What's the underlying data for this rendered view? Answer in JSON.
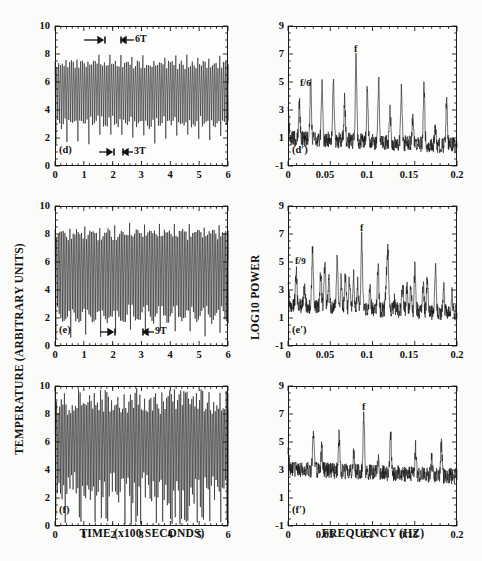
{
  "figure": {
    "caption_absent": true,
    "axis_titles": {
      "left_y": "TEMPERATURE (ARBITRARY UNITS)",
      "left_x": "TIME (x100 SECONDS)",
      "right_y": "LOG10 POWER",
      "right_x": "FREQUENCY (HZ)"
    },
    "ink_color": "#111111",
    "paper_color": "#fbfbf9"
  },
  "chart_data": [
    {
      "id": "d",
      "type": "line",
      "panel_label": "(d)",
      "title": "",
      "xlabel": "TIME (x100 SECONDS)",
      "ylabel": "TEMPERATURE (ARBITRARY UNITS)",
      "xlim": [
        0,
        6
      ],
      "ylim": [
        0,
        10
      ],
      "xticks": [
        0,
        1,
        2,
        3,
        4,
        5,
        6
      ],
      "xticklabels": [
        "0",
        "1",
        "2",
        "3",
        "4",
        "5",
        "6"
      ],
      "yticks": [
        0,
        2,
        4,
        6,
        8,
        10
      ],
      "yticklabels": [
        "0",
        "2",
        "4",
        "6",
        "8",
        "10"
      ],
      "grid": false,
      "series_description": "period-6 relaxation oscillation, temperature vs time",
      "waveform": {
        "base_period": 0.0635,
        "mean": 5.6,
        "fast_amplitude": 1.05,
        "pattern_period_multiple": 6,
        "large_spike_low": 1.9,
        "large_spike_high": 7.7,
        "seed": 41
      },
      "annotations": [
        {
          "label": "6T",
          "type": "interval-bar",
          "x_start": 1.0,
          "x_end": 1.72,
          "y": 9.0,
          "second_bar": {
            "x_start": 2.4,
            "x_end": 2.95
          }
        },
        {
          "label": "3T",
          "type": "interval-bar",
          "x_start": 1.55,
          "x_end": 2.0,
          "y": 0.75,
          "second_bar": {
            "x_start": 2.35,
            "x_end": 2.7
          }
        }
      ]
    },
    {
      "id": "d-prime",
      "type": "line",
      "panel_label": "(d′)",
      "title": "",
      "xlabel": "FREQUENCY (HZ)",
      "ylabel": "LOG10 POWER",
      "xlim": [
        0,
        0.2
      ],
      "ylim": [
        -1,
        9
      ],
      "xticks": [
        0,
        0.05,
        0.1,
        0.15,
        0.2
      ],
      "xticklabels": [
        "0",
        "0.05",
        "0.1",
        "0.15",
        "0.2"
      ],
      "yticks": [
        -1,
        1,
        3,
        5,
        7,
        9
      ],
      "yticklabels": [
        "-1",
        "1",
        "3",
        "5",
        "7",
        "9"
      ],
      "grid": false,
      "series_description": "power spectrum with fundamental f and subharmonic f/6",
      "fundamental_hz": 0.0805,
      "subharmonic_label": "f/6",
      "subharmonic_hz": 0.0134,
      "baseline": 1.0,
      "peaks": [
        {
          "hz": 0.0,
          "power": 3.7
        },
        {
          "hz": 0.0134,
          "power": 3.6
        },
        {
          "hz": 0.0268,
          "power": 5.1
        },
        {
          "hz": 0.0402,
          "power": 5.0
        },
        {
          "hz": 0.0537,
          "power": 5.4
        },
        {
          "hz": 0.0671,
          "power": 3.9
        },
        {
          "hz": 0.0805,
          "power": 7.3
        },
        {
          "hz": 0.0939,
          "power": 4.7
        },
        {
          "hz": 0.1073,
          "power": 5.3
        },
        {
          "hz": 0.1208,
          "power": 3.3
        },
        {
          "hz": 0.1342,
          "power": 4.9
        },
        {
          "hz": 0.1476,
          "power": 2.6
        },
        {
          "hz": 0.161,
          "power": 5.1
        },
        {
          "hz": 0.1744,
          "power": 2.2
        },
        {
          "hz": 0.1878,
          "power": 4.4
        }
      ]
    },
    {
      "id": "e",
      "type": "line",
      "panel_label": "(e)",
      "title": "",
      "xlabel": "TIME (x100 SECONDS)",
      "ylabel": "TEMPERATURE (ARBITRARY UNITS)",
      "xlim": [
        0,
        6
      ],
      "ylim": [
        0,
        10
      ],
      "xticks": [
        0,
        1,
        2,
        3,
        4,
        5,
        6
      ],
      "xticklabels": [
        "0",
        "1",
        "2",
        "3",
        "4",
        "5",
        "6"
      ],
      "yticks": [
        0,
        2,
        4,
        6,
        8,
        10
      ],
      "yticklabels": [
        "0",
        "2",
        "4",
        "6",
        "8",
        "10"
      ],
      "grid": false,
      "series_description": "period-9 relaxation oscillation, temperature vs time",
      "waveform": {
        "base_period": 0.0575,
        "mean": 5.7,
        "fast_amplitude": 1.5,
        "pattern_period_multiple": 9,
        "large_spike_low": 0.9,
        "large_spike_high": 8.6,
        "seed": 77
      },
      "annotations": [
        {
          "label": "9T",
          "type": "interval-bar",
          "x_start": 1.6,
          "x_end": 2.05,
          "y": 0.75,
          "second_bar": {
            "x_start": 3.1,
            "x_end": 3.45
          }
        }
      ]
    },
    {
      "id": "e-prime",
      "type": "line",
      "panel_label": "(e′)",
      "title": "",
      "xlabel": "FREQUENCY (HZ)",
      "ylabel": "LOG10 POWER",
      "xlim": [
        0,
        0.2
      ],
      "ylim": [
        -1,
        9
      ],
      "xticks": [
        0,
        0.05,
        0.1,
        0.15,
        0.2
      ],
      "xticklabels": [
        "0",
        "0.05",
        "0.1",
        "0.15",
        "0.2"
      ],
      "yticks": [
        -1,
        1,
        3,
        5,
        7,
        9
      ],
      "yticklabels": [
        "-1",
        "1",
        "3",
        "5",
        "7",
        "9"
      ],
      "grid": false,
      "series_description": "power spectrum with fundamental f and subharmonic f/9",
      "fundamental_hz": 0.0872,
      "subharmonic_label": "f/9",
      "subharmonic_hz": 0.0097,
      "baseline": 1.9,
      "peaks": [
        {
          "hz": 0.0,
          "power": 4.0
        },
        {
          "hz": 0.0097,
          "power": 4.3
        },
        {
          "hz": 0.0194,
          "power": 3.2
        },
        {
          "hz": 0.0291,
          "power": 6.2
        },
        {
          "hz": 0.0388,
          "power": 4.4
        },
        {
          "hz": 0.0436,
          "power": 5.2
        },
        {
          "hz": 0.0485,
          "power": 4.2
        },
        {
          "hz": 0.0582,
          "power": 5.6
        },
        {
          "hz": 0.063,
          "power": 4.0
        },
        {
          "hz": 0.0679,
          "power": 4.3
        },
        {
          "hz": 0.0727,
          "power": 3.9
        },
        {
          "hz": 0.0776,
          "power": 4.2
        },
        {
          "hz": 0.0824,
          "power": 3.6
        },
        {
          "hz": 0.0872,
          "power": 7.4
        },
        {
          "hz": 0.0969,
          "power": 3.5
        },
        {
          "hz": 0.1066,
          "power": 5.2
        },
        {
          "hz": 0.1163,
          "power": 4.0
        },
        {
          "hz": 0.1182,
          "power": 6.0
        },
        {
          "hz": 0.126,
          "power": 2.6
        },
        {
          "hz": 0.1357,
          "power": 3.9
        },
        {
          "hz": 0.1406,
          "power": 3.6
        },
        {
          "hz": 0.1454,
          "power": 3.8
        },
        {
          "hz": 0.1503,
          "power": 5.3
        },
        {
          "hz": 0.16,
          "power": 3.7
        },
        {
          "hz": 0.1648,
          "power": 4.1
        },
        {
          "hz": 0.1745,
          "power": 5.1
        },
        {
          "hz": 0.1842,
          "power": 3.6
        },
        {
          "hz": 0.1939,
          "power": 3.3
        }
      ]
    },
    {
      "id": "f",
      "type": "line",
      "panel_label": "(f)",
      "title": "",
      "xlabel": "TIME (x100 SECONDS)",
      "ylabel": "TEMPERATURE (ARBITRARY UNITS)",
      "xlim": [
        0,
        6
      ],
      "ylim": [
        0,
        10
      ],
      "xticks": [
        0,
        1,
        2,
        3,
        4,
        5,
        6
      ],
      "xticklabels": [
        "0",
        "1",
        "2",
        "3",
        "4",
        "5",
        "6"
      ],
      "yticks": [
        0,
        2,
        4,
        6,
        8,
        10
      ],
      "yticklabels": [
        "0",
        "2",
        "4",
        "6",
        "8",
        "10"
      ],
      "grid": false,
      "series_description": "chaotic (aperiodic) oscillation, temperature vs time",
      "waveform": {
        "base_period": 0.0545,
        "mean": 6.2,
        "fast_amplitude": 1.7,
        "pattern_period_multiple": 0,
        "large_spike_low": 0.4,
        "large_spike_high": 9.6,
        "seed": 123
      },
      "annotations": []
    },
    {
      "id": "f-prime",
      "type": "line",
      "panel_label": "(f′)",
      "title": "",
      "xlabel": "FREQUENCY (HZ)",
      "ylabel": "LOG10 POWER",
      "xlim": [
        0,
        0.2
      ],
      "ylim": [
        -1,
        9
      ],
      "xticks": [
        0,
        0.05,
        0.1,
        0.15,
        0.2
      ],
      "xticklabels": [
        "0",
        "0.05",
        "0.1",
        "0.15",
        "0.2"
      ],
      "yticks": [
        -1,
        1,
        3,
        5,
        7,
        9
      ],
      "yticklabels": [
        "-1",
        "1",
        "3",
        "5",
        "7",
        "9"
      ],
      "grid": false,
      "series_description": "broadband chaotic power spectrum with fundamental f",
      "fundamental_hz": 0.0897,
      "subharmonic_label": "",
      "baseline": 3.1,
      "peaks": [
        {
          "hz": 0.0,
          "power": 4.6
        },
        {
          "hz": 0.03,
          "power": 6.0
        },
        {
          "hz": 0.04,
          "power": 4.7
        },
        {
          "hz": 0.0605,
          "power": 5.6
        },
        {
          "hz": 0.078,
          "power": 4.4
        },
        {
          "hz": 0.0897,
          "power": 7.3
        },
        {
          "hz": 0.107,
          "power": 4.2
        },
        {
          "hz": 0.1215,
          "power": 6.0
        },
        {
          "hz": 0.151,
          "power": 5.0
        },
        {
          "hz": 0.17,
          "power": 4.2
        },
        {
          "hz": 0.1815,
          "power": 5.4
        }
      ]
    }
  ],
  "panels": {
    "d": {
      "label": "(d)"
    },
    "dp": {
      "label": "(d′)",
      "peak_f": "f",
      "peak_sub_num": "f",
      "peak_sub_den": "6"
    },
    "e": {
      "label": "(e)"
    },
    "ep": {
      "label": "(e′)",
      "peak_f": "f",
      "peak_sub_num": "f",
      "peak_sub_den": "9"
    },
    "f": {
      "label": "(f)"
    },
    "fp": {
      "label": "(f′)",
      "peak_f": "f"
    }
  },
  "annotations": {
    "six_t": "6T",
    "three_t": "3T",
    "nine_t": "9T"
  },
  "ticks": {
    "time_x": [
      "0",
      "1",
      "2",
      "3",
      "4",
      "5",
      "6"
    ],
    "temp_y": [
      "10",
      "8",
      "6",
      "4",
      "2",
      "0"
    ],
    "freq_x": [
      "0",
      "0.05",
      "0.1",
      "0.15",
      "0.2"
    ],
    "power_y": [
      "9",
      "7",
      "5",
      "3",
      "1",
      "-1"
    ]
  }
}
